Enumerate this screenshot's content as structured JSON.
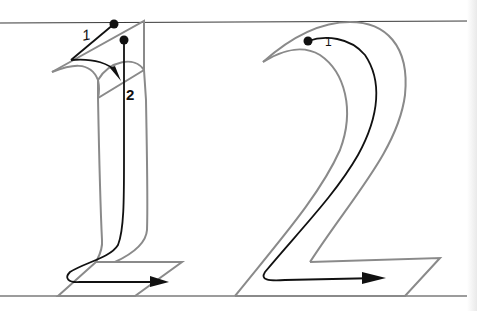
{
  "figure": {
    "type": "handwriting stroke-order diagram",
    "digits": [
      "1",
      "2"
    ],
    "colors": {
      "guide_line": "#3a3a3a",
      "outline": "#8a8a8a",
      "stroke_path": "#111111",
      "background": "#ffffff"
    }
  },
  "digit_one": {
    "stroke_labels": [
      "1",
      "2"
    ]
  },
  "digit_two": {
    "stroke_labels": [
      "1"
    ]
  }
}
